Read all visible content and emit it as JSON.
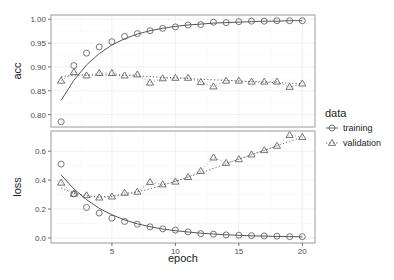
{
  "chart_data": {
    "type": "line",
    "layout": "faceted (2 rows, shared x axis)",
    "x": [
      1,
      2,
      3,
      4,
      5,
      6,
      7,
      8,
      9,
      10,
      11,
      12,
      13,
      14,
      15,
      16,
      17,
      18,
      19,
      20
    ],
    "xlabel": "epoch",
    "xticks": [
      5,
      10,
      15,
      20
    ],
    "xlim": [
      0.2,
      21
    ],
    "grid": true,
    "legend": {
      "title": "data",
      "position": "right",
      "entries": [
        {
          "label": "training",
          "marker": "circle",
          "line": "solid"
        },
        {
          "label": "validation",
          "marker": "triangle",
          "line": "dotted"
        }
      ]
    },
    "panels": [
      {
        "name": "acc",
        "ylabel": "acc",
        "yticks": [
          0.8,
          0.85,
          0.9,
          0.95,
          1.0
        ],
        "ytick_labels": [
          "0.80",
          "0.85",
          "0.90",
          "0.95",
          "1.00"
        ],
        "ylim": [
          0.774,
          1.009
        ],
        "series": [
          {
            "name": "training",
            "values": [
              0.785,
              0.903,
              0.929,
              0.942,
              0.953,
              0.964,
              0.97,
              0.976,
              0.981,
              0.984,
              0.988,
              0.989,
              0.994,
              0.993,
              0.995,
              0.996,
              0.996,
              0.997,
              0.997,
              0.997
            ],
            "smooth": [
              0.83,
              0.872,
              0.904,
              0.928,
              0.946,
              0.959,
              0.969,
              0.976,
              0.981,
              0.985,
              0.988,
              0.99,
              0.992,
              0.993,
              0.994,
              0.995,
              0.996,
              0.996,
              0.997,
              0.997
            ]
          },
          {
            "name": "validation",
            "values": [
              0.871,
              0.889,
              0.882,
              0.887,
              0.887,
              0.882,
              0.884,
              0.867,
              0.876,
              0.877,
              0.877,
              0.868,
              0.859,
              0.871,
              0.871,
              0.869,
              0.869,
              0.869,
              0.858,
              0.865
            ],
            "smooth": [
              0.88,
              0.882,
              0.883,
              0.883,
              0.883,
              0.882,
              0.881,
              0.88,
              0.878,
              0.877,
              0.876,
              0.874,
              0.873,
              0.872,
              0.87,
              0.869,
              0.868,
              0.867,
              0.866,
              0.865
            ]
          }
        ]
      },
      {
        "name": "loss",
        "ylabel": "loss",
        "yticks": [
          0.0,
          0.2,
          0.4,
          0.6
        ],
        "ytick_labels": [
          "0.0",
          "0.2",
          "0.4",
          "0.6"
        ],
        "ylim": [
          -0.035,
          0.74
        ],
        "series": [
          {
            "name": "training",
            "values": [
              0.511,
              0.305,
              0.211,
              0.172,
              0.137,
              0.114,
              0.095,
              0.077,
              0.063,
              0.054,
              0.042,
              0.03,
              0.026,
              0.021,
              0.019,
              0.016,
              0.014,
              0.012,
              0.009,
              0.009
            ],
            "smooth": [
              0.435,
              0.34,
              0.265,
              0.205,
              0.16,
              0.125,
              0.098,
              0.078,
              0.062,
              0.05,
              0.041,
              0.033,
              0.027,
              0.022,
              0.018,
              0.015,
              0.013,
              0.011,
              0.009,
              0.008
            ]
          },
          {
            "name": "validation",
            "values": [
              0.382,
              0.305,
              0.295,
              0.279,
              0.286,
              0.312,
              0.319,
              0.386,
              0.37,
              0.389,
              0.421,
              0.463,
              0.556,
              0.519,
              0.544,
              0.577,
              0.607,
              0.637,
              0.712,
              0.698
            ],
            "smooth": [
              0.345,
              0.31,
              0.29,
              0.284,
              0.288,
              0.3,
              0.318,
              0.34,
              0.365,
              0.392,
              0.421,
              0.451,
              0.482,
              0.513,
              0.544,
              0.575,
              0.606,
              0.637,
              0.668,
              0.698
            ]
          }
        ]
      }
    ]
  },
  "colors": {
    "panel_border": "#9a9a9a",
    "grid": "#ececec",
    "series": "#555555",
    "smooth_line": "#555555"
  }
}
